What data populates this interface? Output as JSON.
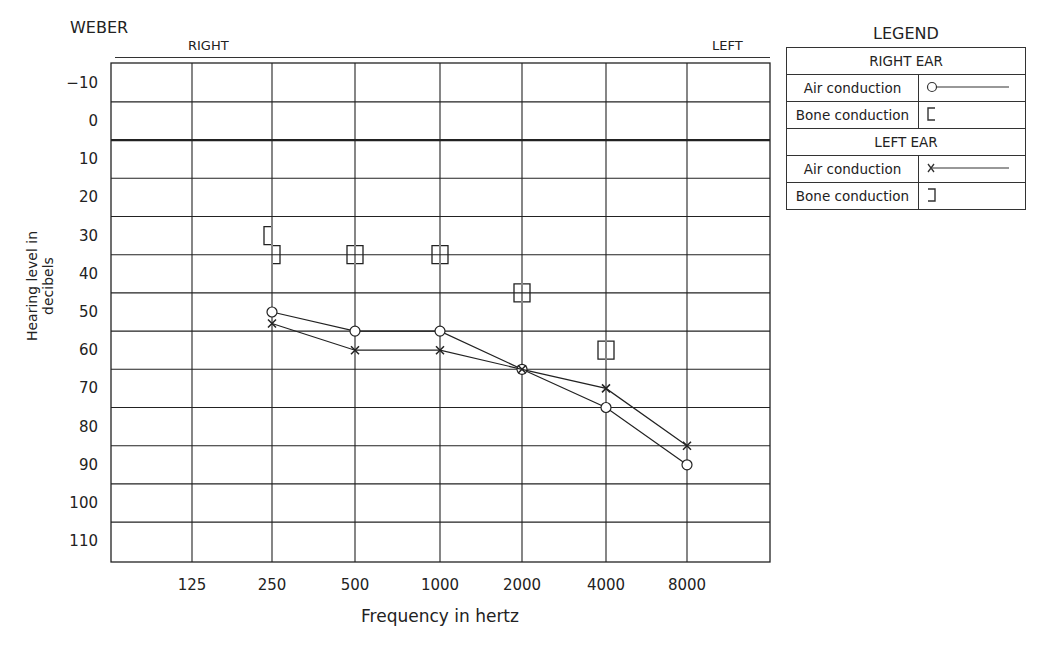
{
  "header": {
    "title": "WEBER",
    "right_label": "RIGHT",
    "left_label": "LEFT"
  },
  "axes": {
    "ylabel": "Hearing level in decibels",
    "xlabel": "Frequency in hertz"
  },
  "legend": {
    "title": "LEGEND",
    "right_ear": "RIGHT  EAR",
    "left_ear": "LEFT  EAR",
    "air": "Air conduction",
    "bone": "Bone conduction"
  },
  "chart_data": {
    "type": "line",
    "title": "WEBER",
    "xlabel": "Frequency in hertz",
    "ylabel": "Hearing level in decibels",
    "x": [
      125,
      250,
      500,
      1000,
      2000,
      4000,
      8000
    ],
    "y_ticks": [
      -10,
      0,
      10,
      20,
      30,
      40,
      50,
      60,
      70,
      80,
      90,
      100,
      110
    ],
    "ylim": [
      -15,
      115
    ],
    "y_inverted": true,
    "grid": true,
    "legend_position": "right",
    "series": [
      {
        "name": "Right ear air conduction",
        "marker": "O",
        "values": [
          null,
          50,
          55,
          55,
          65,
          75,
          90
        ]
      },
      {
        "name": "Left ear air conduction",
        "marker": "X",
        "values": [
          null,
          53,
          60,
          60,
          65,
          70,
          85
        ]
      },
      {
        "name": "Right ear bone conduction",
        "marker": "[",
        "values": [
          null,
          30,
          35,
          35,
          45,
          60,
          null
        ]
      },
      {
        "name": "Left ear bone conduction",
        "marker": "]",
        "values": [
          null,
          35,
          35,
          35,
          45,
          60,
          null
        ]
      }
    ]
  }
}
